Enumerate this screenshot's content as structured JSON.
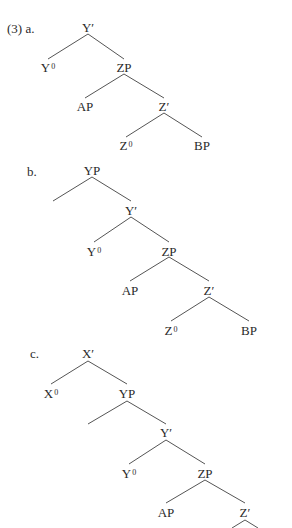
{
  "example_number": "(3)",
  "trees": [
    {
      "id": "a",
      "label": "a.",
      "nodes": [
        {
          "id": "a-Ybar",
          "text": "Y′",
          "sup": "",
          "x": 88,
          "y": 21
        },
        {
          "id": "a-Y0",
          "text": "Y",
          "sup": "0",
          "x": 48,
          "y": 61
        },
        {
          "id": "a-ZP",
          "text": "ZP",
          "sup": "",
          "x": 124,
          "y": 61
        },
        {
          "id": "a-AP",
          "text": "AP",
          "sup": "",
          "x": 85,
          "y": 100
        },
        {
          "id": "a-Zbar",
          "text": "Z′",
          "sup": "",
          "x": 164,
          "y": 100
        },
        {
          "id": "a-Z0",
          "text": "Z",
          "sup": "0",
          "x": 126,
          "y": 139
        },
        {
          "id": "a-BP",
          "text": "BP",
          "sup": "",
          "x": 202,
          "y": 139
        }
      ],
      "edges": [
        [
          88,
          34,
          48,
          59
        ],
        [
          88,
          34,
          124,
          59
        ],
        [
          124,
          74,
          85,
          98
        ],
        [
          124,
          74,
          164,
          98
        ],
        [
          164,
          113,
          126,
          137
        ],
        [
          164,
          113,
          202,
          137
        ]
      ]
    },
    {
      "id": "b",
      "label": "b.",
      "nodes": [
        {
          "id": "b-YP",
          "text": "YP",
          "sup": "",
          "x": 92,
          "y": 164
        },
        {
          "id": "b-Ybar",
          "text": "Y′",
          "sup": "",
          "x": 131,
          "y": 204
        },
        {
          "id": "b-Y0",
          "text": "Y",
          "sup": "0",
          "x": 94,
          "y": 245
        },
        {
          "id": "b-ZP",
          "text": "ZP",
          "sup": "",
          "x": 169,
          "y": 245
        },
        {
          "id": "b-AP",
          "text": "AP",
          "sup": "",
          "x": 130,
          "y": 284
        },
        {
          "id": "b-Zbar",
          "text": "Z′",
          "sup": "",
          "x": 209,
          "y": 284
        },
        {
          "id": "b-Z0",
          "text": "Z",
          "sup": "0",
          "x": 171,
          "y": 324
        },
        {
          "id": "b-BP",
          "text": "BP",
          "sup": "",
          "x": 249,
          "y": 324
        }
      ],
      "edges": [
        [
          92,
          177,
          53,
          201
        ],
        [
          92,
          177,
          131,
          201
        ],
        [
          131,
          217,
          94,
          242
        ],
        [
          131,
          217,
          169,
          242
        ],
        [
          169,
          257,
          130,
          281
        ],
        [
          169,
          257,
          209,
          281
        ],
        [
          209,
          297,
          171,
          321
        ],
        [
          209,
          297,
          249,
          321
        ]
      ]
    },
    {
      "id": "c",
      "label": "c.",
      "nodes": [
        {
          "id": "c-Xbar",
          "text": "X′",
          "sup": "",
          "x": 88,
          "y": 347
        },
        {
          "id": "c-X0",
          "text": "X",
          "sup": "0",
          "x": 51,
          "y": 387
        },
        {
          "id": "c-YP",
          "text": "YP",
          "sup": "",
          "x": 127,
          "y": 387
        },
        {
          "id": "c-Ybar",
          "text": "Y′",
          "sup": "",
          "x": 166,
          "y": 426
        },
        {
          "id": "c-Y0",
          "text": "Y",
          "sup": "0",
          "x": 129,
          "y": 467
        },
        {
          "id": "c-ZP",
          "text": "ZP",
          "sup": "",
          "x": 205,
          "y": 467
        },
        {
          "id": "c-AP",
          "text": "AP",
          "sup": "",
          "x": 166,
          "y": 506
        },
        {
          "id": "c-Zbar",
          "text": "Z′",
          "sup": "",
          "x": 245,
          "y": 506
        }
      ],
      "edges": [
        [
          88,
          361,
          51,
          384
        ],
        [
          88,
          361,
          127,
          384
        ],
        [
          127,
          401,
          88,
          424
        ],
        [
          127,
          401,
          166,
          424
        ],
        [
          166,
          440,
          129,
          464
        ],
        [
          166,
          440,
          205,
          464
        ],
        [
          205,
          480,
          166,
          503
        ],
        [
          205,
          480,
          245,
          503
        ],
        [
          245,
          520,
          232,
          528
        ],
        [
          245,
          520,
          258,
          528
        ]
      ]
    }
  ],
  "example_labels": [
    {
      "text": "(3)  a.",
      "x": 7,
      "y": 22
    },
    {
      "text": "b.",
      "x": 27,
      "y": 165
    },
    {
      "text": "c.",
      "x": 30,
      "y": 347
    }
  ],
  "colors": {
    "text": "#2a2a2a",
    "line": "#555555",
    "background": "#ffffff"
  }
}
